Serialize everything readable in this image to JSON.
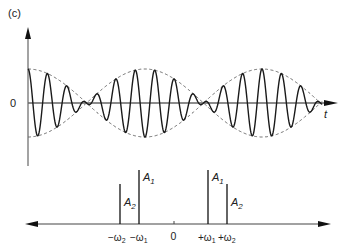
{
  "figure": {
    "panel_label": "(c)",
    "time_plot": {
      "y_zero_label": "0",
      "x_axis_label": "t",
      "signal": "sum of two sinusoids (beats) with dashed envelope",
      "envelope_style": "dashed",
      "colors": {
        "signal": "#1a1a1a",
        "axis": "#555555",
        "envelope": "#666666"
      }
    },
    "spectrum": {
      "origin_label": "0",
      "lines": [
        {
          "id": "neg-omega2",
          "tick_label": "−ω",
          "tick_sub": "2",
          "amp_label": "A",
          "amp_sub": "2",
          "height": "A2"
        },
        {
          "id": "neg-omega1",
          "tick_label": "−ω",
          "tick_sub": "1",
          "amp_label": "A",
          "amp_sub": "1",
          "height": "A1"
        },
        {
          "id": "pos-omega1",
          "tick_label": "+ω",
          "tick_sub": "1",
          "amp_label": "A",
          "amp_sub": "1",
          "height": "A1"
        },
        {
          "id": "pos-omega2",
          "tick_label": "+ω",
          "tick_sub": "2",
          "amp_label": "A",
          "amp_sub": "2",
          "height": "A2"
        }
      ]
    }
  }
}
